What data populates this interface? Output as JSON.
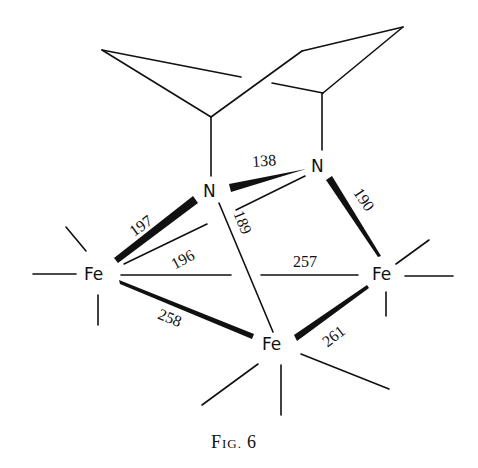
{
  "figure": {
    "caption_prefix": "F",
    "caption_smallcaps": "IG.",
    "caption_number": "6"
  },
  "atoms": {
    "n1": "N",
    "n2": "N",
    "fe_left": "Fe",
    "fe_right": "Fe",
    "fe_bottom": "Fe"
  },
  "bond_lengths": {
    "n_n": "138",
    "n1_fe_left_a": "197",
    "n1_fe_left_b": "196",
    "n1_fe_bottom": "189",
    "n2_fe_right": "190",
    "fe_left_fe_right": "257",
    "fe_left_fe_bottom": "258",
    "fe_right_fe_bottom": "261"
  },
  "colors": {
    "ink": "#111111",
    "background": "#ffffff"
  }
}
